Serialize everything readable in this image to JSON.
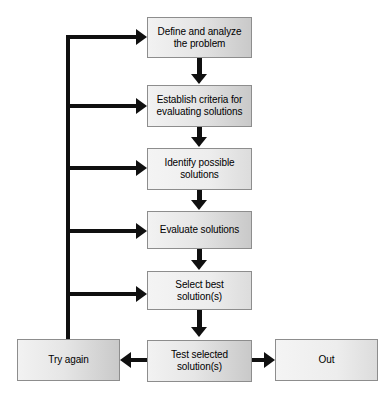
{
  "diagram": {
    "type": "flowchart",
    "title": "",
    "background_color": "#ffffff",
    "node_fill_light": "#f2f2f2",
    "node_fill_dark": "#c9c9c9",
    "node_border_color": "#8d8d8d",
    "connector_color": "#101010",
    "text_color": "#000000",
    "nodes": [
      {
        "id": "define",
        "label": "Define and analyze\nthe problem",
        "x": 147,
        "y": 17,
        "w": 105,
        "h": 41
      },
      {
        "id": "establish",
        "label": "Establish criteria for\nevaluating solutions",
        "x": 147,
        "y": 85,
        "w": 105,
        "h": 42
      },
      {
        "id": "identify",
        "label": "Identify possible\nsolutions",
        "x": 147,
        "y": 148,
        "w": 105,
        "h": 42
      },
      {
        "id": "evaluate",
        "label": "Evaluate solutions",
        "x": 147,
        "y": 211,
        "w": 105,
        "h": 38
      },
      {
        "id": "select",
        "label": "Select best\nsolution(s)",
        "x": 147,
        "y": 271,
        "w": 105,
        "h": 39
      },
      {
        "id": "test",
        "label": "Test selected\nsolution(s)",
        "x": 147,
        "y": 340,
        "w": 105,
        "h": 42
      },
      {
        "id": "try-again",
        "label": "Try again",
        "x": 17,
        "y": 339,
        "w": 103,
        "h": 42
      },
      {
        "id": "out",
        "label": "Out",
        "x": 275,
        "y": 339,
        "w": 103,
        "h": 42
      }
    ],
    "connectors": [
      {
        "id": "define-to-establish",
        "from": "define",
        "to": "establish",
        "direction": "down"
      },
      {
        "id": "establish-to-identify",
        "from": "establish",
        "to": "identify",
        "direction": "down"
      },
      {
        "id": "identify-to-evaluate",
        "from": "identify",
        "to": "evaluate",
        "direction": "down"
      },
      {
        "id": "evaluate-to-select",
        "from": "evaluate",
        "to": "select",
        "direction": "down"
      },
      {
        "id": "select-to-test",
        "from": "select",
        "to": "test",
        "direction": "down"
      },
      {
        "id": "test-to-try-again",
        "from": "test",
        "to": "try-again",
        "direction": "left"
      },
      {
        "id": "test-to-out",
        "from": "test",
        "to": "out",
        "direction": "right"
      },
      {
        "id": "feedback-to-define",
        "from": "try-again",
        "to": "define",
        "direction": "right"
      },
      {
        "id": "feedback-to-establish",
        "from": "try-again",
        "to": "establish",
        "direction": "right"
      },
      {
        "id": "feedback-to-identify",
        "from": "try-again",
        "to": "identify",
        "direction": "right"
      },
      {
        "id": "feedback-to-evaluate",
        "from": "try-again",
        "to": "evaluate",
        "direction": "right"
      },
      {
        "id": "feedback-to-select",
        "from": "try-again",
        "to": "select",
        "direction": "right"
      }
    ]
  }
}
